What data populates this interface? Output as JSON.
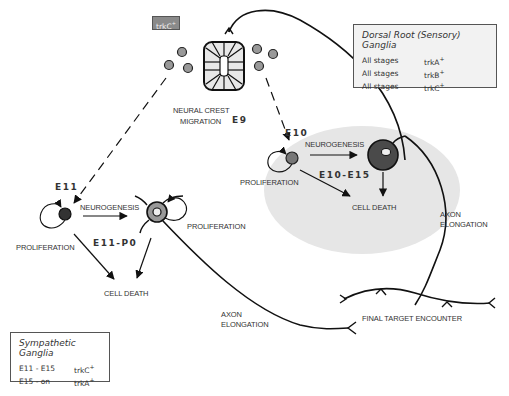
{
  "neural_crest": {
    "label_line1": "NEURAL CREST",
    "label_line2": "MIGRATION",
    "stage": "E9",
    "tag": {
      "text": "trkC",
      "sup": "+"
    }
  },
  "drg": {
    "stage_start": "E10",
    "neurogenesis": "NEUROGENESIS",
    "proliferation": "PROLIFERATION",
    "stage_range": "E10-E15",
    "cell_death": "CELL DEATH",
    "axon_line1": "AXON",
    "axon_line2": "ELONGATION"
  },
  "sympathetic": {
    "stage_start": "E11",
    "neurogenesis": "NEUROGENESIS",
    "proliferation_left": "PROLIFERATION",
    "proliferation_right": "PROLIFERATION",
    "stage_range": "E11-P0",
    "cell_death": "CELL DEATH",
    "axon_line1": "AXON",
    "axon_line2": "ELONGATION"
  },
  "target": {
    "label": "FINAL TARGET ENCOUNTER"
  },
  "legend_drg": {
    "title": "Dorsal Root (Sensory) Ganglia",
    "rows": [
      {
        "stage": "All stages",
        "receptor": "trkA",
        "sup": "+"
      },
      {
        "stage": "All stages",
        "receptor": "trkB",
        "sup": "+"
      },
      {
        "stage": "All stages",
        "receptor": "trkC",
        "sup": "+"
      }
    ]
  },
  "legend_sympathetic": {
    "title": "Sympathetic Ganglia",
    "rows": [
      {
        "stage": "E11 - E15",
        "receptor": "trkC",
        "sup": "+"
      },
      {
        "stage": "E15 - on",
        "receptor": "trkA",
        "sup": "+"
      }
    ]
  },
  "colors": {
    "drg_region": "#e6e6e6",
    "cell_dark": "#3a3a3a",
    "cell_gray": "#7d7d7d",
    "cell_light": "#a0a0a0",
    "line": "#111111"
  }
}
